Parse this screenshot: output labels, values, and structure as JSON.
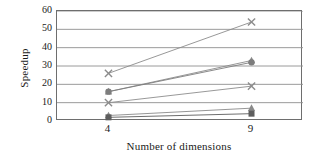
{
  "chart_data": {
    "type": "line",
    "title": "",
    "xlabel": "Number of dimensions",
    "ylabel": "Speedup",
    "x": [
      4,
      9
    ],
    "categories": [
      "4",
      "9"
    ],
    "xtick_labels": [
      "4",
      "9"
    ],
    "ytick_labels": [
      "0",
      "10",
      "20",
      "30",
      "40",
      "50",
      "60"
    ],
    "ytick_values": [
      0,
      10,
      20,
      30,
      40,
      50,
      60
    ],
    "xlim": [
      2.2,
      10.8
    ],
    "ylim": [
      0,
      60
    ],
    "grid": "horizontal",
    "legend": "none",
    "series": [
      {
        "name": "series-1",
        "marker": "cross",
        "color": "#8c8c8c",
        "values": [
          26,
          54
        ]
      },
      {
        "name": "series-2",
        "marker": "triangle",
        "color": "#8a8a8a",
        "values": [
          16,
          33
        ]
      },
      {
        "name": "series-3",
        "marker": "circle",
        "color": "#7d7d7d",
        "values": [
          16,
          32
        ]
      },
      {
        "name": "series-4",
        "marker": "cross",
        "color": "#8c8c8c",
        "values": [
          10,
          19
        ]
      },
      {
        "name": "series-5",
        "marker": "triangle",
        "color": "#8a8a8a",
        "values": [
          3,
          7
        ]
      },
      {
        "name": "series-6",
        "marker": "square",
        "color": "#5e5e5e",
        "values": [
          2,
          4
        ]
      }
    ]
  },
  "axes": {
    "y_title": "Speedup",
    "x_title": "Number of dimensions"
  }
}
